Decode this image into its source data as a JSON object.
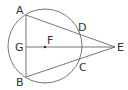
{
  "diagram": {
    "type": "geometry",
    "colors": {
      "stroke": "#555555",
      "text": "#333333",
      "background": "#ffffff"
    },
    "circle": {
      "cx": 45,
      "cy": 46,
      "r": 37
    },
    "points": {
      "A": {
        "label": "A",
        "x": 26,
        "y": 15
      },
      "B": {
        "label": "B",
        "x": 26,
        "y": 77
      },
      "G": {
        "label": "G",
        "x": 26,
        "y": 47
      },
      "F": {
        "label": "F",
        "x": 45,
        "y": 47
      },
      "E": {
        "label": "E",
        "x": 115,
        "y": 47
      },
      "D": {
        "label": "D",
        "x": 78,
        "y": 32
      },
      "C": {
        "label": "C",
        "x": 78,
        "y": 62
      }
    },
    "segments": [
      "AB",
      "GE",
      "AE",
      "BE"
    ],
    "center_dot": "F"
  }
}
